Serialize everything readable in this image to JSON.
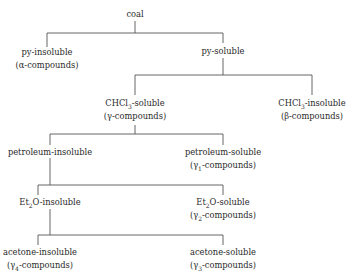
{
  "diagram": {
    "type": "tree",
    "line_color": "#555555",
    "nodes": {
      "coal": {
        "label": "coal"
      },
      "py_insoluble": {
        "label": "py-insoluble",
        "sub": "(α-compounds)"
      },
      "py_soluble": {
        "label": "py-soluble"
      },
      "chcl3_soluble": {
        "label_pre": "CHCl",
        "label_sub": "3",
        "label_post": "-soluble",
        "sub": "(γ-compounds)"
      },
      "chcl3_insoluble": {
        "label_pre": "CHCl",
        "label_sub": "3",
        "label_post": "-insoluble",
        "sub": "(β-compounds)"
      },
      "petroleum_insoluble": {
        "label": "petroleum-insoluble"
      },
      "petroleum_soluble": {
        "label": "petroleum-soluble",
        "sub_pre": "(γ",
        "sub_sub": "1",
        "sub_post": "-compounds)"
      },
      "et2o_insoluble": {
        "label_pre": "Et",
        "label_sub": "2",
        "label_post": "O-insoluble"
      },
      "et2o_soluble": {
        "label_pre": "Et",
        "label_sub": "2",
        "label_post": "O-soluble",
        "sub_pre": "(γ",
        "sub_sub": "2",
        "sub_post": "-compounds)"
      },
      "acetone_insoluble": {
        "label": "acetone-insoluble",
        "sub_pre": "(γ",
        "sub_sub": "4",
        "sub_post": "-compounds)"
      },
      "acetone_soluble": {
        "label": "acetone-soluble",
        "sub_pre": "(γ",
        "sub_sub": "3",
        "sub_post": "-compounds)"
      }
    },
    "edges": [
      [
        "coal",
        "py_insoluble"
      ],
      [
        "coal",
        "py_soluble"
      ],
      [
        "py_soluble",
        "chcl3_soluble"
      ],
      [
        "py_soluble",
        "chcl3_insoluble"
      ],
      [
        "chcl3_soluble",
        "petroleum_insoluble"
      ],
      [
        "chcl3_soluble",
        "petroleum_soluble"
      ],
      [
        "petroleum_insoluble",
        "et2o_insoluble"
      ],
      [
        "petroleum_insoluble",
        "et2o_soluble"
      ],
      [
        "et2o_insoluble",
        "acetone_insoluble"
      ],
      [
        "et2o_insoluble",
        "acetone_soluble"
      ]
    ]
  }
}
